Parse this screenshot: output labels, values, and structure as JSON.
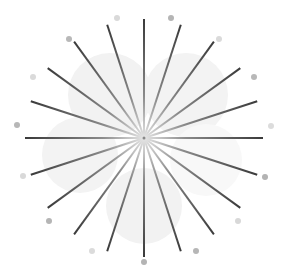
{
  "diagram": {
    "type": "starburst",
    "width": 282,
    "height": 272,
    "center": {
      "x": 144,
      "y": 138
    },
    "ray_count": 20,
    "ray_angle_step_deg": 18,
    "ray_length": 119,
    "ray_color_outer": "#3a3a3a",
    "ray_color_inner": "#e6e6e6",
    "ray_width": 2,
    "center_dot_color": "#888888",
    "blobs": [
      {
        "cx": 110,
        "cy": 95,
        "r": 42,
        "color": "#f2f2f2"
      },
      {
        "cx": 186,
        "cy": 95,
        "r": 42,
        "color": "#f3f3f3"
      },
      {
        "cx": 80,
        "cy": 155,
        "r": 38,
        "color": "#f3f3f3"
      },
      {
        "cx": 144,
        "cy": 206,
        "r": 38,
        "color": "#f2f2f2"
      },
      {
        "cx": 206,
        "cy": 160,
        "r": 36,
        "color": "#f8f8f8"
      }
    ],
    "dots": [
      {
        "x": 117,
        "y": 18,
        "r": 3,
        "color": "#d9d9d9"
      },
      {
        "x": 171,
        "y": 18,
        "r": 3,
        "color": "#b5b5b5"
      },
      {
        "x": 219,
        "y": 39,
        "r": 3,
        "color": "#dadada"
      },
      {
        "x": 254,
        "y": 77,
        "r": 3,
        "color": "#b8b8b8"
      },
      {
        "x": 271,
        "y": 126,
        "r": 3,
        "color": "#dcdcdc"
      },
      {
        "x": 265,
        "y": 177,
        "r": 3,
        "color": "#b3b3b3"
      },
      {
        "x": 238,
        "y": 221,
        "r": 3,
        "color": "#d8d8d8"
      },
      {
        "x": 196,
        "y": 251,
        "r": 3,
        "color": "#b6b6b6"
      },
      {
        "x": 144,
        "y": 262,
        "r": 3,
        "color": "#b4b4b4"
      },
      {
        "x": 92,
        "y": 251,
        "r": 3,
        "color": "#dbdbdb"
      },
      {
        "x": 49,
        "y": 221,
        "r": 3,
        "color": "#b5b5b5"
      },
      {
        "x": 23,
        "y": 176,
        "r": 3,
        "color": "#d9d9d9"
      },
      {
        "x": 17,
        "y": 125,
        "r": 3,
        "color": "#b7b7b7"
      },
      {
        "x": 33,
        "y": 77,
        "r": 3,
        "color": "#dadada"
      },
      {
        "x": 69,
        "y": 39,
        "r": 3,
        "color": "#b8b8b8"
      }
    ]
  }
}
